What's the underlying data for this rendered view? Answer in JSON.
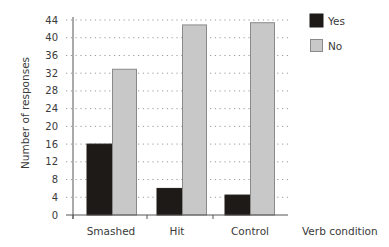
{
  "chart_data": {
    "type": "bar",
    "title": "",
    "xlabel": "Verb condition",
    "ylabel": "Number of responses",
    "ylim": [
      0,
      44
    ],
    "yticks": [
      0,
      4,
      8,
      12,
      16,
      20,
      24,
      28,
      32,
      36,
      40,
      44
    ],
    "grid": "horizontal dotted",
    "legend_position": "top-right",
    "categories": [
      "Smashed",
      "Hit",
      "Control"
    ],
    "series": [
      {
        "name": "Yes",
        "color": "#1e1a18",
        "values": [
          16,
          6,
          4.5
        ]
      },
      {
        "name": "No",
        "color": "#c8c8c8",
        "values": [
          33,
          43,
          43.5
        ]
      }
    ]
  },
  "legend": {
    "items": [
      {
        "label": "Yes",
        "color": "#1e1a18"
      },
      {
        "label": "No",
        "color": "#c8c8c8"
      }
    ]
  }
}
